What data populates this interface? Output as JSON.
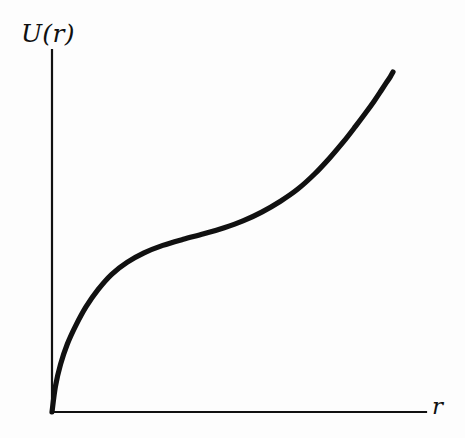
{
  "figure": {
    "background_color": "#fdfdfd",
    "ink_color": "#111111",
    "y_axis_label": "U(r)",
    "x_axis_label": "r"
  },
  "chart_data": {
    "type": "line",
    "title": "",
    "subtitle": "",
    "xlabel": "r",
    "ylabel": "U(r)",
    "grid": false,
    "legend": null,
    "annotations": [],
    "axes": {
      "x_tick_labels": [],
      "y_tick_labels": [],
      "xlim": [
        0,
        1
      ],
      "ylim": [
        0,
        1
      ],
      "origin_at": [
        0,
        0
      ],
      "arrowheads": false,
      "axis_style": "open L-shaped axes, no ticks, no gridlines"
    },
    "series": [
      {
        "name": "U(r)",
        "color": "#111111",
        "line_width": 5.2,
        "x": [
          0.0,
          0.01,
          0.025,
          0.045,
          0.07,
          0.1,
          0.135,
          0.175,
          0.22,
          0.27,
          0.325,
          0.385,
          0.445,
          0.505,
          0.56,
          0.615,
          0.67,
          0.72,
          0.77,
          0.815,
          0.855,
          0.89,
          0.92,
          0.945,
          0.965,
          0.98,
          0.992,
          1.0
        ],
        "y": [
          0.0,
          0.075,
          0.14,
          0.2,
          0.255,
          0.31,
          0.36,
          0.405,
          0.44,
          0.468,
          0.49,
          0.508,
          0.524,
          0.542,
          0.562,
          0.588,
          0.62,
          0.655,
          0.7,
          0.748,
          0.795,
          0.84,
          0.88,
          0.915,
          0.945,
          0.968,
          0.986,
          1.0
        ]
      }
    ]
  }
}
